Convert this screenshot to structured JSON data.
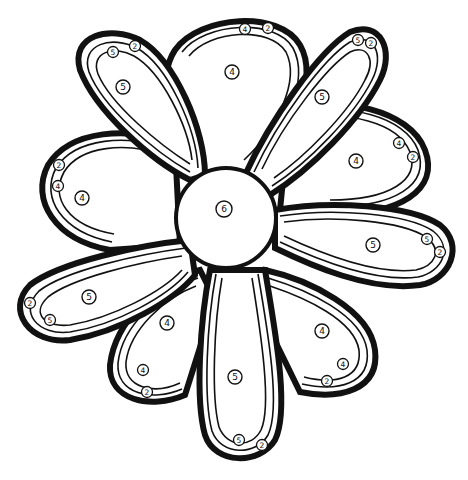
{
  "page": {
    "type": "color-by-number coloring page"
  },
  "legend_numbers": [
    "2",
    "4",
    "5",
    "6"
  ],
  "regions": {
    "center": {
      "label": "6"
    },
    "back_petals": [
      {
        "name": "top",
        "label": "4",
        "band_labels": [
          "4",
          "2"
        ]
      },
      {
        "name": "right",
        "label": "4",
        "band_labels": [
          "4",
          "2"
        ]
      },
      {
        "name": "left",
        "label": "4",
        "band_labels": [
          "2",
          "4"
        ]
      },
      {
        "name": "bottom-left",
        "label": "4",
        "band_labels": [
          "4",
          "2"
        ]
      },
      {
        "name": "bottom-right",
        "label": "4",
        "band_labels": [
          "4",
          "2"
        ]
      }
    ],
    "front_petals": [
      {
        "name": "upper-left",
        "label": "5",
        "band_labels": [
          "5",
          "2"
        ]
      },
      {
        "name": "upper-right",
        "label": "5",
        "band_labels": [
          "5",
          "2"
        ]
      },
      {
        "name": "right",
        "label": "5",
        "band_labels": [
          "5",
          "2"
        ]
      },
      {
        "name": "left",
        "label": "5",
        "band_labels": [
          "2",
          "5"
        ]
      },
      {
        "name": "bottom",
        "label": "5",
        "band_labels": [
          "5",
          "2"
        ]
      }
    ]
  },
  "colors": {
    "line": "#111111",
    "background": "#ffffff"
  }
}
